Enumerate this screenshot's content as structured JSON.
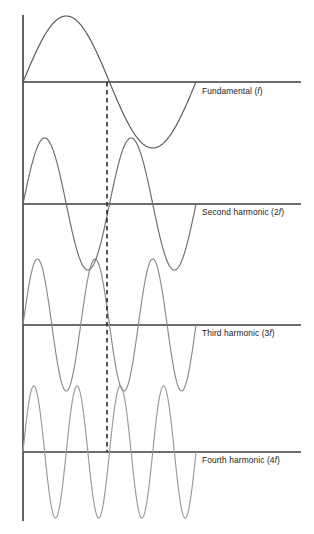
{
  "figure": {
    "background_color": "#ffffff",
    "width": 314,
    "height": 534
  },
  "axes": {
    "vertical_axis_color": "#3c3c3c",
    "zero_line_color": "#3c3c3c",
    "dashed_marker_color": "#2b2b2b",
    "dashed_marker_label": "half-period marker"
  },
  "chart_data": {
    "type": "line",
    "xlabel": "",
    "ylabel": "",
    "grid": false,
    "legend_position": "right-inline",
    "x": [
      0,
      1
    ],
    "xlim": [
      0,
      1
    ],
    "ylim": [
      -1,
      1
    ],
    "annotations": [
      {
        "name": "half-period-dashed-line",
        "x": 0.5,
        "style": "dashed",
        "from_panel": 1,
        "to_panel": 4
      }
    ],
    "series": [
      {
        "name": "Fundamental (f)",
        "label_plain": "Fundamental",
        "label_math": "(f)",
        "multiplier": "",
        "symbol": "f",
        "cycles": 1,
        "amplitude": 1,
        "color": "#555555",
        "panel": 1
      },
      {
        "name": "Second harmonic (2f)",
        "label_plain": "Second harmonic",
        "label_math": "(2f)",
        "multiplier": "2",
        "symbol": "f",
        "cycles": 2,
        "amplitude": 1,
        "color": "#6b6b6b",
        "panel": 2
      },
      {
        "name": "Third harmonic (3f)",
        "label_plain": "Third harmonic",
        "label_math": "(3f)",
        "multiplier": "3",
        "symbol": "f",
        "cycles": 3,
        "amplitude": 1,
        "color": "#8a8a8a",
        "panel": 3
      },
      {
        "name": "Fourth harmonic (4f)",
        "label_plain": "Fourth harmonic",
        "label_math": "(4f)",
        "multiplier": "4",
        "symbol": "f",
        "cycles": 4,
        "amplitude": 1,
        "color": "#9a9a9a",
        "panel": 4
      }
    ]
  },
  "labels": {
    "fundamental": {
      "prefix": "Fundamental (",
      "symbol": "f",
      "suffix": ")"
    },
    "second": {
      "prefix": "Second harmonic (2",
      "symbol": "f",
      "suffix": ")"
    },
    "third": {
      "prefix": "Third harmonic (3",
      "symbol": "f",
      "suffix": ")"
    },
    "fourth": {
      "prefix": "Fourth harmonic (4",
      "symbol": "f",
      "suffix": ")"
    }
  }
}
